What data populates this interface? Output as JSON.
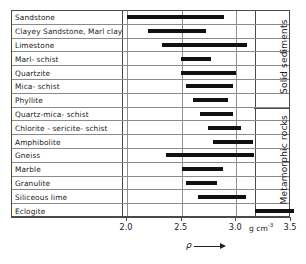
{
  "chart_data": {
    "type": "bar",
    "orientation": "horizontal-range",
    "title": "",
    "xlabel": "ρ",
    "ylabel": "",
    "units": "g cm-3",
    "xlim": [
      1.75,
      3.55
    ],
    "grid": true,
    "xticks": [
      2.0,
      2.5,
      3.0,
      3.5
    ],
    "xtick_labels": [
      "2.0",
      "2.5",
      "3.0",
      "3.5"
    ],
    "categories": [
      "Sandstone",
      "Clayey Sandstone, Marl clay",
      "Limestone",
      "Marl- schist",
      "Quartzite",
      "Mica- schist",
      "Phyllite",
      "Quartz-mica- schist",
      "Chlorite - sericite- schist",
      "Amphibolite",
      "Gneiss",
      "Marble",
      "Granulite",
      "Siliceous lime",
      "Eclogite"
    ],
    "ranges": [
      [
        2.0,
        2.89
      ],
      [
        2.19,
        2.72
      ],
      [
        2.32,
        3.1
      ],
      [
        2.49,
        2.77
      ],
      [
        2.49,
        3.0
      ],
      [
        2.54,
        2.97
      ],
      [
        2.6,
        2.92
      ],
      [
        2.67,
        2.97
      ],
      [
        2.74,
        3.04
      ],
      [
        2.79,
        3.15
      ],
      [
        2.36,
        3.16
      ],
      [
        2.5,
        2.88
      ],
      [
        2.54,
        2.82
      ],
      [
        2.65,
        3.09
      ],
      [
        3.17,
        3.53
      ]
    ],
    "groups": [
      {
        "label": "Solid  sediments",
        "from_row": 1,
        "to_row": 7
      },
      {
        "label": "Metamorphic rocks",
        "from_row": 8,
        "to_row": 15
      }
    ]
  },
  "axis": {
    "tick_labels": [
      "2.0",
      "2.5",
      "3.0",
      "3.5"
    ],
    "unit_text": "g cm",
    "unit_exponent": "-3",
    "symbol": "ρ"
  }
}
